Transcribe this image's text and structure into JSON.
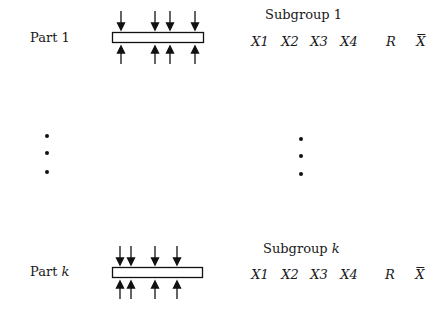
{
  "diagram": {
    "rows": [
      {
        "part_label": "Part",
        "part_index": "1",
        "part_index_italic": false,
        "subgroup_label": "Subgroup",
        "subgroup_index": "1",
        "subgroup_index_italic": false,
        "columns": [
          "X1",
          "X2",
          "X3",
          "X4",
          "R",
          "X"
        ],
        "measurement_arrow_positions": [
          121,
          155,
          170,
          195
        ]
      },
      {
        "part_label": "Part",
        "part_index": "k",
        "part_index_italic": true,
        "subgroup_label": "Subgroup",
        "subgroup_index": "k",
        "subgroup_index_italic": true,
        "columns": [
          "X1",
          "X2",
          "X3",
          "X4",
          "R",
          "X"
        ],
        "measurement_arrow_positions": [
          120,
          131,
          155,
          177
        ]
      }
    ],
    "ellipsis_left": "⋮",
    "ellipsis_right": "⋮",
    "column_notes": {
      "X": "X-bar (sample mean)",
      "R": "Range"
    }
  }
}
